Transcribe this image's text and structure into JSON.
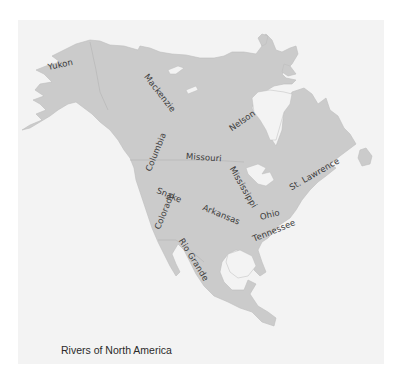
{
  "map": {
    "title": "Rivers of North America",
    "colors": {
      "page_background": "#ffffff",
      "panel_background": "#f3f3f3",
      "land": "#cbcbcb",
      "label_text": "#3a3a3a"
    },
    "rivers": [
      {
        "name": "Yukon",
        "x": 48,
        "y": 67,
        "rotate": -12
      },
      {
        "name": "Mackenzie",
        "x": 146,
        "y": 74,
        "rotate": 52
      },
      {
        "name": "Nelson",
        "x": 229,
        "y": 125,
        "rotate": -35
      },
      {
        "name": "Columbia",
        "x": 149,
        "y": 168,
        "rotate": -68
      },
      {
        "name": "Missouri",
        "x": 186,
        "y": 155,
        "rotate": 4
      },
      {
        "name": "Mississippi",
        "x": 233,
        "y": 166,
        "rotate": 60
      },
      {
        "name": "St. Lawrence",
        "x": 290,
        "y": 183,
        "rotate": -30
      },
      {
        "name": "Snake",
        "x": 157,
        "y": 190,
        "rotate": 22
      },
      {
        "name": "Arkansas",
        "x": 204,
        "y": 206,
        "rotate": 22
      },
      {
        "name": "Ohio",
        "x": 260,
        "y": 216,
        "rotate": -14
      },
      {
        "name": "Colorado",
        "x": 158,
        "y": 227,
        "rotate": -68
      },
      {
        "name": "Tennessee",
        "x": 254,
        "y": 232,
        "rotate": -22
      },
      {
        "name": "Rio Grande",
        "x": 182,
        "y": 238,
        "rotate": 58
      }
    ]
  }
}
